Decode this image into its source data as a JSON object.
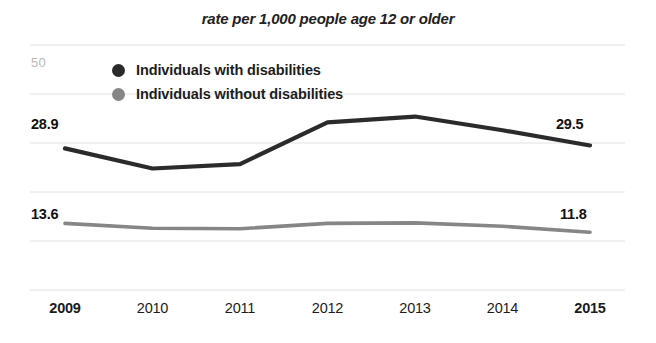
{
  "chart_data": {
    "type": "line",
    "title": "rate per 1,000 people age 12 or older",
    "xlabel": "",
    "ylabel": "",
    "categories": [
      "2009",
      "2010",
      "2011",
      "2012",
      "2013",
      "2014",
      "2015"
    ],
    "bold_categories": [
      "2009",
      "2015"
    ],
    "ylim": [
      0,
      50
    ],
    "y_axis_max_label": "50",
    "grid": true,
    "gridlines": [
      50,
      40,
      30,
      20,
      10,
      0
    ],
    "legend_position": "inside-top-left",
    "series": [
      {
        "name": "Individuals with disabilities",
        "color": "#2b2b2b",
        "values": [
          28.9,
          24.8,
          25.7,
          34.2,
          35.4,
          32.6,
          29.5
        ],
        "start_label": "28.9",
        "end_label": "29.5"
      },
      {
        "name": "Individuals without disabilities",
        "color": "#868686",
        "values": [
          13.6,
          12.6,
          12.5,
          13.6,
          13.7,
          13.0,
          11.8
        ],
        "start_label": "13.6",
        "end_label": "11.8"
      }
    ],
    "annotations": [
      "28.9",
      "29.5",
      "13.6",
      "11.8"
    ]
  },
  "colors": {
    "series_with_disabilities": "#2b2b2b",
    "series_without_disabilities": "#868686",
    "gridline": "#e2e2e2",
    "axis_label": "#b9b9b9",
    "background": "#ffffff"
  }
}
